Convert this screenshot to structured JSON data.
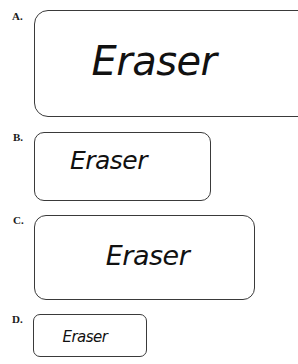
{
  "options": [
    {
      "label": "A.",
      "text": "Eraser"
    },
    {
      "label": "B.",
      "text": "Eraser"
    },
    {
      "label": "C.",
      "text": "Eraser"
    },
    {
      "label": "D.",
      "text": "Eraser"
    }
  ]
}
